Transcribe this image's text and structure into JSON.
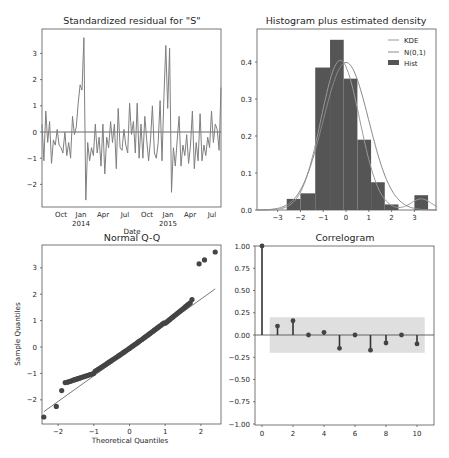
{
  "figure": {
    "background": "#ffffff",
    "line_color": "#7f7f7f",
    "bar_color": "#555555"
  },
  "chart_data": [
    {
      "type": "line",
      "title": "Standardized residual for \"S\"",
      "xlabel": "Date",
      "ylabel": "",
      "xticks": [
        "Oct",
        "Jan\n2014",
        "Apr",
        "Jul",
        "Oct",
        "Jan\n2015",
        "Apr",
        "Jul"
      ],
      "xtick_labels": {
        "t0": "Oct",
        "t1": "Jan",
        "t1b": "2014",
        "t2": "Apr",
        "t3": "Jul",
        "t4": "Oct",
        "t5": "Jan",
        "t5b": "2015",
        "t6": "Apr",
        "t7": "Jul"
      },
      "yticks": [
        "3",
        "2",
        "1",
        "0",
        "-1",
        "-2"
      ],
      "ylim": [
        -2.9,
        3.9
      ],
      "hline": 0,
      "values": [
        0.3,
        -1.1,
        0.8,
        -0.4,
        0.4,
        -1.2,
        -0.3,
        -0.5,
        0.1,
        -0.5,
        -0.6,
        -0.8,
        0.0,
        -0.9,
        -0.4,
        -1.0,
        0.6,
        -0.1,
        0.2,
        1.1,
        1.8,
        1.6,
        3.6,
        -2.6,
        -0.4,
        -1.1,
        -0.6,
        -0.9,
        0.3,
        -0.8,
        -0.2,
        -1.3,
        0.3,
        -1.6,
        -0.2,
        -0.6,
        0.4,
        -0.4,
        0.3,
        -1.4,
        0.9,
        -0.6,
        -0.7,
        0.1,
        -0.5,
        -0.8,
        1.1,
        -0.1,
        0.4,
        -0.8,
        1.1,
        -1.0,
        0.3,
        -1.0,
        0.6,
        -0.3,
        -1.1,
        -0.3,
        1.0,
        -0.8,
        -1.0,
        -0.4,
        1.2,
        -1.1,
        1.3,
        3.3,
        0.9,
        3.2,
        -2.3,
        -0.6,
        -1.3,
        -0.3,
        0.6,
        -1.3,
        -0.5,
        -0.9,
        -0.1,
        -1.2,
        -0.5,
        0.8,
        -1.4,
        -0.4,
        -1.1,
        0.7,
        -1.1,
        -0.5,
        -0.9,
        -0.2,
        -0.6,
        0.8,
        -0.4,
        0.3,
        0.1,
        -0.7,
        1.7
      ]
    },
    {
      "type": "bar",
      "title": "Histogram plus estimated density",
      "xticks": [
        "-3",
        "-2",
        "-1",
        "0",
        "1",
        "2",
        "3"
      ],
      "yticks": [
        "0.0",
        "0.1",
        "0.2",
        "0.3",
        "0.4"
      ],
      "xlim": [
        -3.9,
        4.0
      ],
      "ylim": [
        0,
        0.48
      ],
      "bins": [
        {
          "x0": -2.6,
          "x1": -2.0,
          "h": 0.03
        },
        {
          "x0": -2.0,
          "x1": -1.35,
          "h": 0.045
        },
        {
          "x0": -1.35,
          "x1": -0.7,
          "h": 0.385
        },
        {
          "x0": -0.7,
          "x1": -0.1,
          "h": 0.46
        },
        {
          "x0": -0.1,
          "x1": 0.5,
          "h": 0.355
        },
        {
          "x0": 0.5,
          "x1": 1.1,
          "h": 0.19
        },
        {
          "x0": 1.1,
          "x1": 1.7,
          "h": 0.075
        },
        {
          "x0": 1.7,
          "x1": 2.3,
          "h": 0.015
        },
        {
          "x0": 3.0,
          "x1": 3.6,
          "h": 0.04
        }
      ],
      "legend": [
        {
          "label": "KDE",
          "kind": "line",
          "color": "#999999"
        },
        {
          "label": "N(0,1)",
          "kind": "line",
          "color": "#8a8a8a"
        },
        {
          "label": "Hist",
          "kind": "patch",
          "color": "#555555"
        }
      ],
      "legend_position": "upper right"
    },
    {
      "type": "scatter",
      "title": "Normal Q-Q",
      "xlabel": "Theoretical Quantiles",
      "ylabel": "Sample Quantiles",
      "xticks": [
        "-2",
        "-1",
        "0",
        "1",
        "2"
      ],
      "yticks": [
        "3",
        "2",
        "1",
        "0",
        "-1",
        "-2"
      ],
      "xlim": [
        -2.45,
        2.5
      ],
      "ylim": [
        -2.9,
        3.9
      ],
      "reference_line": {
        "x0": -2.4,
        "y0": -2.45,
        "x1": 2.4,
        "y1": 2.2
      },
      "points_extremes": [
        [
          -2.4,
          -2.65
        ],
        [
          -2.05,
          -2.25
        ],
        [
          -1.9,
          -1.65
        ],
        [
          -1.8,
          -1.35
        ],
        [
          1.75,
          1.8
        ],
        [
          1.95,
          3.15
        ],
        [
          2.1,
          3.3
        ],
        [
          2.4,
          3.6
        ]
      ]
    },
    {
      "type": "stem",
      "title": "Correlogram",
      "xticks": [
        "0",
        "2",
        "4",
        "6",
        "8",
        "10"
      ],
      "yticks": [
        "1.00",
        "0.75",
        "0.50",
        "0.25",
        "0.00",
        "-0.25",
        "-0.50",
        "-0.75",
        "-1.00"
      ],
      "ylim": [
        -1.0,
        1.0
      ],
      "xlim": [
        -0.5,
        11.0
      ],
      "lags": [
        0,
        1,
        2,
        3,
        4,
        5,
        6,
        7,
        8,
        9,
        10
      ],
      "acf": [
        1.0,
        0.1,
        0.16,
        0.0,
        0.03,
        -0.15,
        0.0,
        -0.17,
        -0.09,
        0.0,
        -0.1
      ],
      "confidence_band": [
        0.2,
        -0.2
      ]
    }
  ]
}
